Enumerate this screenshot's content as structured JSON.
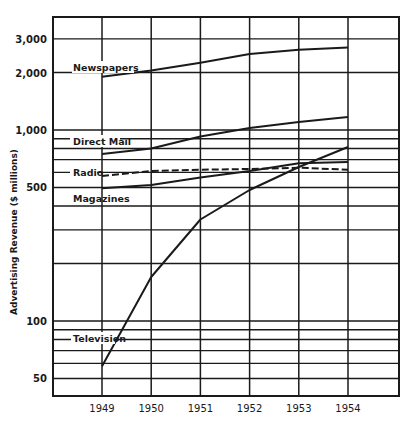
{
  "chart_data": {
    "type": "line",
    "title": "",
    "xlabel": "",
    "ylabel": "Advertising Revenue ($ millions)",
    "yscale": "log",
    "ylim": [
      45,
      3600
    ],
    "x": [
      1949,
      1950,
      1951,
      1952,
      1953,
      1954
    ],
    "x_tick_labels": [
      "1949",
      "1950",
      "1951",
      "1952",
      "1953",
      "1954"
    ],
    "y_tick_labels": [
      "3,000",
      "2,000",
      "1,000",
      "500",
      "100",
      "50"
    ],
    "y_tick_values": [
      3000,
      2000,
      1000,
      500,
      100,
      50
    ],
    "gridlines": [
      3000,
      2000,
      1000,
      900,
      800,
      700,
      600,
      500,
      400,
      300,
      200,
      100,
      90,
      80,
      70,
      60,
      50
    ],
    "grid": true,
    "legend": "inline labels",
    "series": [
      {
        "name": "Newspapers",
        "style": "solid",
        "values": [
          1900,
          2050,
          2250,
          2500,
          2630,
          2700
        ]
      },
      {
        "name": "Direct Mail",
        "style": "solid",
        "values": [
          750,
          800,
          925,
          1025,
          1100,
          1170
        ]
      },
      {
        "name": "Radio",
        "style": "dashed",
        "values": [
          575,
          610,
          620,
          625,
          635,
          620
        ]
      },
      {
        "name": "Magazines",
        "style": "solid",
        "values": [
          495,
          515,
          565,
          610,
          670,
          680
        ]
      },
      {
        "name": "Television",
        "style": "solid",
        "values": [
          58,
          170,
          340,
          485,
          640,
          815
        ]
      }
    ]
  },
  "labels": {
    "newspapers": "Newspapers",
    "direct_mail": "Direct Mail",
    "radio": "Radio",
    "magazines": "Magazines",
    "television": "Television"
  },
  "colors": {
    "ink": "#1a1a1a",
    "background": "#ffffff"
  }
}
